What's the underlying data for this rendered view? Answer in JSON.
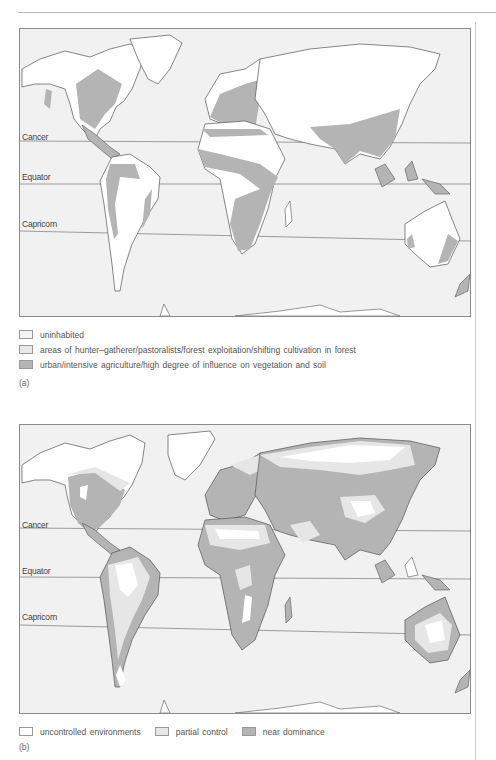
{
  "colors": {
    "ocean": "#f1f1f1",
    "land_light": "#ffffff",
    "land_mid": "#e6e6e6",
    "land_dark": "#b4b4b4",
    "coastline": "#555555",
    "frame": "#8a8a8a"
  },
  "figure_a": {
    "label": "(a)",
    "lines": {
      "cancer": "Cancer",
      "equator": "Equator",
      "capricorn": "Capricorn"
    },
    "legend": [
      {
        "swatch": "uninhabited",
        "label": "uninhabited"
      },
      {
        "swatch": "light",
        "label": "areas of hunter–gatherer/pastoralists/forest exploitation/shifting cultivation in forest"
      },
      {
        "swatch": "dark",
        "label": "urban/intensive agriculture/high degree of influence on vegetation and soil"
      }
    ]
  },
  "figure_b": {
    "label": "(b)",
    "lines": {
      "cancer": "Cancer",
      "equator": "Equator",
      "capricorn": "Capricorn"
    },
    "legend": [
      {
        "swatch": "white",
        "label": "uncontrolled environments"
      },
      {
        "swatch": "light",
        "label": "partial control"
      },
      {
        "swatch": "dark",
        "label": "near dominance"
      }
    ]
  }
}
